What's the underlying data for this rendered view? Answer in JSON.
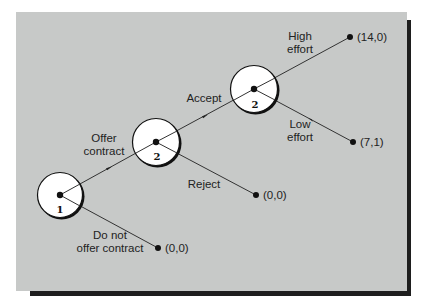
{
  "diagram": {
    "type": "game-tree",
    "background_color": "#c7c9c8",
    "line_color": "#333333",
    "nodes": [
      {
        "id": "n1",
        "player": "1",
        "cx": 60,
        "cy": 195,
        "r": 23
      },
      {
        "id": "n2",
        "player": "2",
        "cx": 156,
        "cy": 142,
        "r": 24
      },
      {
        "id": "n3",
        "player": "2",
        "cx": 254,
        "cy": 89,
        "r": 24
      }
    ],
    "edges": [
      {
        "from": "n1",
        "to": "n2",
        "label": "Offer contract",
        "label_lines": [
          "Offer",
          "contract"
        ]
      },
      {
        "from": "n1",
        "to": "t1",
        "label": "Do not offer contract",
        "label_lines": [
          "Do not",
          "offer contract"
        ]
      },
      {
        "from": "n2",
        "to": "n3",
        "label": "Accept",
        "label_lines": [
          "Accept"
        ]
      },
      {
        "from": "n2",
        "to": "t2",
        "label": "Reject",
        "label_lines": [
          "Reject"
        ]
      },
      {
        "from": "n3",
        "to": "t3",
        "label": "High effort",
        "label_lines": [
          "High",
          "effort"
        ]
      },
      {
        "from": "n3",
        "to": "t4",
        "label": "Low effort",
        "label_lines": [
          "Low",
          "effort"
        ]
      }
    ],
    "terminals": [
      {
        "id": "t1",
        "payoff": "(0,0)"
      },
      {
        "id": "t2",
        "payoff": "(0,0)"
      },
      {
        "id": "t3",
        "payoff": "(14,0)"
      },
      {
        "id": "t4",
        "payoff": "(7,1)"
      }
    ]
  }
}
